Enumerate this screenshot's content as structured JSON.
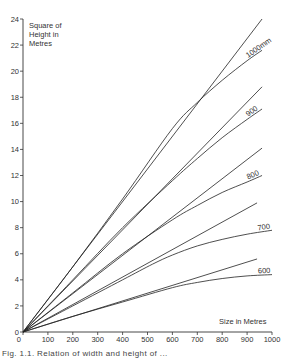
{
  "chart_data": {
    "type": "line",
    "title": "",
    "xlabel": "Size in Metres",
    "ylabel": "Square of Height in Metres",
    "xlim": [
      0,
      1000
    ],
    "ylim": [
      0,
      24
    ],
    "x_ticks": [
      0,
      100,
      200,
      300,
      400,
      500,
      600,
      700,
      800,
      900,
      1000
    ],
    "y_ticks": [
      0,
      2,
      4,
      6,
      8,
      10,
      12,
      14,
      16,
      18,
      20,
      22,
      24
    ],
    "grid": false,
    "legend": "inline labels at right end of curves",
    "series": [
      {
        "name": "1000mm (linear)",
        "label": "",
        "x": [
          0,
          960
        ],
        "y": [
          0,
          24.0
        ]
      },
      {
        "name": "1000mm",
        "label": "1000mm",
        "x": [
          0,
          200,
          400,
          600,
          700,
          800,
          900,
          960
        ],
        "y": [
          0,
          5.0,
          10.2,
          15.6,
          17.6,
          19.3,
          20.8,
          21.6
        ]
      },
      {
        "name": "900 (linear)",
        "label": "",
        "x": [
          0,
          960
        ],
        "y": [
          0,
          18.8
        ]
      },
      {
        "name": "900",
        "label": "900",
        "x": [
          0,
          200,
          400,
          600,
          700,
          800,
          900,
          960
        ],
        "y": [
          0,
          4.0,
          8.0,
          11.6,
          13.3,
          14.9,
          16.3,
          17.1
        ]
      },
      {
        "name": "800 (linear)",
        "label": "",
        "x": [
          0,
          960
        ],
        "y": [
          0,
          14.1
        ]
      },
      {
        "name": "800",
        "label": "800",
        "x": [
          0,
          200,
          400,
          600,
          700,
          800,
          900,
          960
        ],
        "y": [
          0,
          3.0,
          6.0,
          8.6,
          9.7,
          10.7,
          11.5,
          12.0
        ]
      },
      {
        "name": "700 (linear)",
        "label": "",
        "x": [
          0,
          940
        ],
        "y": [
          0,
          9.9
        ]
      },
      {
        "name": "700",
        "label": "700",
        "x": [
          0,
          200,
          400,
          520,
          600,
          700,
          800,
          900,
          1000
        ],
        "y": [
          0,
          2.0,
          4.0,
          5.2,
          5.9,
          6.6,
          7.1,
          7.5,
          7.8
        ]
      },
      {
        "name": "600 (linear)",
        "label": "",
        "x": [
          0,
          940
        ],
        "y": [
          0,
          5.6
        ]
      },
      {
        "name": "600",
        "label": "600",
        "x": [
          0,
          200,
          400,
          600,
          700,
          800,
          900,
          1000
        ],
        "y": [
          0,
          1.2,
          2.3,
          3.4,
          3.8,
          4.1,
          4.3,
          4.4
        ]
      }
    ],
    "annotations": [
      "1000mm",
      "900",
      "800",
      "700",
      "600"
    ]
  },
  "axes": {
    "y_title_lines": [
      "Square of",
      "Height in",
      "Metres"
    ],
    "x_title": "Size in Metres"
  },
  "caption": "Fig. 1.1. Relation of width and height of ..."
}
